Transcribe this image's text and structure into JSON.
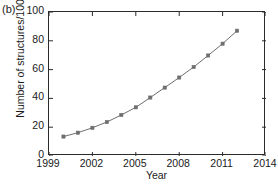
{
  "panel": {
    "label": "(b)"
  },
  "chart_data": {
    "type": "line",
    "title": "",
    "xlabel": "Year",
    "ylabel": "Number of structures/1000",
    "xlim": [
      1999,
      2014
    ],
    "ylim": [
      0,
      100
    ],
    "xticks": [
      1999,
      2002,
      2005,
      2008,
      2011,
      2014
    ],
    "yticks": [
      0,
      20,
      40,
      60,
      80,
      100
    ],
    "xtick_labels": [
      "1999",
      "2002",
      "2005",
      "2008",
      "2011",
      "2014"
    ],
    "ytick_labels": [
      "0",
      "20",
      "40",
      "60",
      "80",
      "100"
    ],
    "grid": false,
    "legend": null,
    "marker": "square",
    "line_color": "#6e6e6e",
    "marker_color": "#6e6e6e",
    "x": [
      2000,
      2001,
      2002,
      2003,
      2004,
      2005,
      2006,
      2007,
      2008,
      2009,
      2010,
      2011,
      2012
    ],
    "values": [
      13.5,
      16.2,
      19.6,
      23.6,
      28.5,
      33.8,
      40.6,
      47.5,
      54.5,
      61.8,
      69.8,
      78.0,
      87.0
    ],
    "series": [
      {
        "name": "Number of structures",
        "values": [
          13.5,
          16.2,
          19.6,
          23.6,
          28.5,
          33.8,
          40.6,
          47.5,
          54.5,
          61.8,
          69.8,
          78.0,
          87.0
        ]
      }
    ]
  }
}
